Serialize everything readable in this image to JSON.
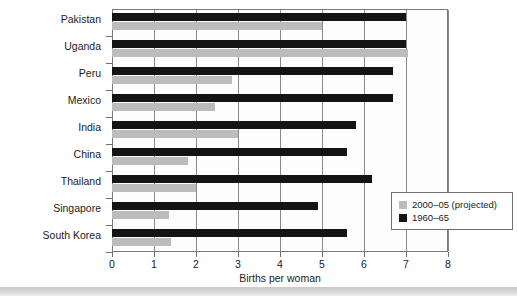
{
  "chart_data": {
    "type": "bar",
    "orientation": "horizontal",
    "title": "",
    "xlabel": "Births per woman",
    "ylabel": "",
    "xlim": [
      0,
      8
    ],
    "xticks": [
      0,
      1,
      2,
      3,
      4,
      5,
      6,
      7,
      8
    ],
    "xtick_labels": [
      "0",
      "1",
      "2",
      "3",
      "4",
      "5",
      "6",
      "7",
      "8"
    ],
    "grid": true,
    "grid_axis": "x",
    "legend_position": "bottom-right",
    "categories": [
      "Pakistan",
      "Uganda",
      "Peru",
      "Mexico",
      "India",
      "China",
      "Thailand",
      "Singapore",
      "South Korea"
    ],
    "series": [
      {
        "name": "1960–65",
        "color": "#141414",
        "values": [
          7.0,
          7.0,
          6.7,
          6.7,
          5.8,
          5.6,
          6.2,
          4.9,
          5.6
        ]
      },
      {
        "name": "2000–05 (projected)",
        "color": "#bcbcbc",
        "values": [
          5.0,
          7.05,
          2.85,
          2.45,
          3.0,
          1.8,
          2.0,
          1.35,
          1.4
        ]
      }
    ]
  },
  "legend": {
    "items": [
      {
        "label": "2000–05 (projected)",
        "color": "#bcbcbc"
      },
      {
        "label": "1960–65",
        "color": "#141414"
      }
    ]
  },
  "axis": {
    "x_title": "Births per woman"
  }
}
